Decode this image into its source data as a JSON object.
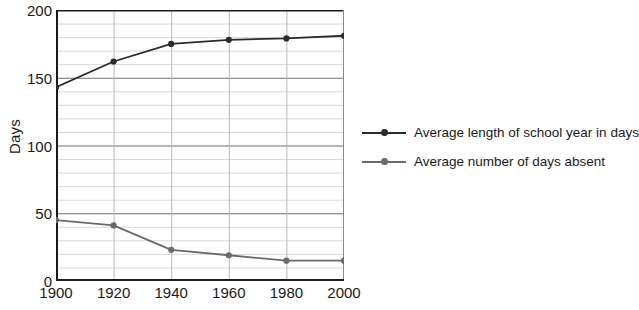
{
  "chart_data": {
    "type": "line",
    "title": "",
    "xlabel": "",
    "ylabel": "Days",
    "x": [
      1900,
      1920,
      1940,
      1960,
      1980,
      2000
    ],
    "categories": [
      "1900",
      "1920",
      "1940",
      "1960",
      "1980",
      "2000"
    ],
    "xlim": [
      1900,
      2000
    ],
    "ylim": [
      0,
      200
    ],
    "y_ticks": [
      0,
      50,
      100,
      150,
      200
    ],
    "y_tick_labels": [
      "0",
      "50",
      "100",
      "150",
      "200"
    ],
    "y_minor_step": 10,
    "grid": true,
    "legend_position": "right",
    "series": [
      {
        "name": "Average length of school year in days",
        "color": "#2b2b2b",
        "values": [
          143,
          162,
          175,
          178,
          179,
          181
        ]
      },
      {
        "name": "Average number of days absent",
        "color": "#6b6b6b",
        "values": [
          45,
          41,
          23,
          19,
          15,
          15
        ]
      }
    ]
  },
  "axes": {
    "y_title": "Days",
    "y_tick_labels": [
      "200",
      "150",
      "100",
      "50",
      "0"
    ],
    "y_tick_values": [
      200,
      150,
      100,
      50,
      0
    ],
    "x_tick_labels": [
      "1900",
      "1920",
      "1940",
      "1960",
      "1980",
      "2000"
    ]
  },
  "legend": {
    "items": [
      {
        "label": "Average length of school year in days",
        "color": "#2b2b2b"
      },
      {
        "label": "Average number of days absent",
        "color": "#6b6b6b"
      }
    ]
  },
  "colors": {
    "series_1": "#2b2b2b",
    "series_2": "#6b6b6b",
    "axis": "#1a1a1a",
    "major_grid": "#6e6e6e",
    "minor_grid": "#d8d8d8",
    "background": "#ffffff"
  }
}
